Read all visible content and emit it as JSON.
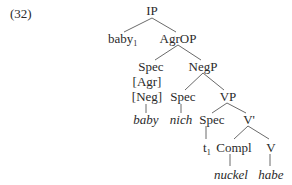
{
  "example_number": "(32)",
  "tree": {
    "ip": "IP",
    "baby_moved": "baby",
    "baby_index": "1",
    "agrop": "AgrOP",
    "spec_agr": "Spec",
    "feature_agr": "[Agr]",
    "feature_neg": "[Neg]",
    "negp": "NegP",
    "spec_neg": "Spec",
    "vp": "VP",
    "baby_leaf": "baby",
    "nich_leaf": "nich",
    "spec_vp": "Spec",
    "v_bar": "V'",
    "trace": "t",
    "trace_index": "1",
    "compl": "Compl",
    "v": "V",
    "nuckel_leaf": "nuckel",
    "habe_leaf": "habe"
  }
}
